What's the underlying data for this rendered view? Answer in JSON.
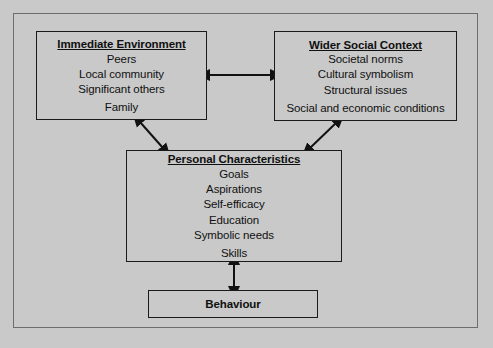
{
  "diagram": {
    "background_color": "#c9c9c9",
    "border_color": "#1a1a1a",
    "nodes": [
      {
        "id": "immediate-environment",
        "title": "Immediate Environment",
        "items": [
          "Peers",
          "Local community",
          "Significant others",
          "Family"
        ]
      },
      {
        "id": "wider-social-context",
        "title": "Wider Social Context",
        "items": [
          "Societal norms",
          "Cultural symbolism",
          "Structural issues",
          "Social and economic conditions"
        ]
      },
      {
        "id": "personal-characteristics",
        "title": "Personal Characteristics",
        "items": [
          "Goals",
          "Aspirations",
          "Self-efficacy",
          "Education",
          "Symbolic needs",
          "Skills"
        ]
      },
      {
        "id": "behaviour",
        "title": "Behaviour",
        "items": []
      }
    ],
    "connectors": [
      {
        "id": "immediate-to-wider",
        "from": "immediate-environment",
        "to": "wider-social-context",
        "style": "double-headed",
        "orientation": "horizontal"
      },
      {
        "id": "immediate-to-personal",
        "from": "immediate-environment",
        "to": "personal-characteristics",
        "style": "double-headed",
        "orientation": "diagonal"
      },
      {
        "id": "wider-to-personal",
        "from": "wider-social-context",
        "to": "personal-characteristics",
        "style": "double-headed",
        "orientation": "diagonal"
      },
      {
        "id": "personal-to-behaviour",
        "from": "personal-characteristics",
        "to": "behaviour",
        "style": "double-headed",
        "orientation": "vertical"
      }
    ]
  }
}
